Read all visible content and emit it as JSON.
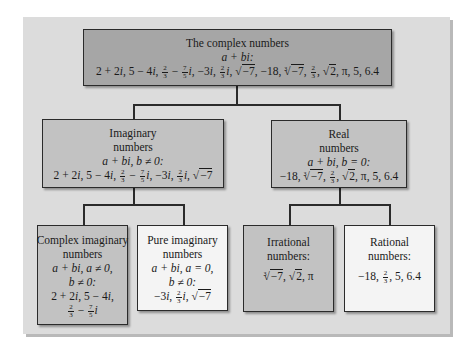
{
  "diagram": {
    "title": "The complex numbers",
    "nodes": {
      "complex": {
        "title": "The complex numbers",
        "form": "a + bi:",
        "examples": [
          "2 + 2i",
          "5 − 4i",
          "2/3 − 7/5 i",
          "−3i",
          "2/3 i",
          "√−7",
          "−18",
          "∛−7",
          "2/3",
          "√2",
          "π",
          "5",
          "6.4"
        ]
      },
      "imaginary": {
        "title_line1": "Imaginary",
        "title_line2": "numbers",
        "form": "a + bi, b ≠ 0:",
        "examples": [
          "2 + 2i",
          "5 − 4i",
          "2/3 − 7/5 i",
          "−3i",
          "2/3 i",
          "√−7"
        ]
      },
      "real": {
        "title_line1": "Real",
        "title_line2": "numbers",
        "form": "a + bi, b = 0:",
        "examples": [
          "−18",
          "∛−7",
          "2/3",
          "√2",
          "π",
          "5",
          "6.4"
        ]
      },
      "complex_imaginary": {
        "title_line1": "Complex imaginary",
        "title_line2": "numbers",
        "form_line1": "a + bi, a ≠ 0,",
        "form_line2": "b ≠ 0:",
        "examples": [
          "2 + 2i",
          "5 − 4i",
          "2/3 − 7/5 i"
        ]
      },
      "pure_imaginary": {
        "title_line1": "Pure imaginary",
        "title_line2": "numbers",
        "form_line1": "a + bi, a = 0,",
        "form_line2": "b ≠ 0:",
        "examples": [
          "−3i",
          "2/3 i",
          "√−7"
        ]
      },
      "irrational": {
        "title_line1": "Irrational",
        "title_line2": "numbers:",
        "examples": [
          "∛−7",
          "√2",
          "π"
        ]
      },
      "rational": {
        "title_line1": "Rational",
        "title_line2": "numbers:",
        "examples": [
          "−18",
          "2/3",
          "5",
          "6.4"
        ]
      }
    },
    "edges": [
      [
        "complex",
        "imaginary"
      ],
      [
        "complex",
        "real"
      ],
      [
        "imaginary",
        "complex_imaginary"
      ],
      [
        "imaginary",
        "pure_imaginary"
      ],
      [
        "real",
        "irrational"
      ],
      [
        "real",
        "rational"
      ]
    ],
    "colors": {
      "panel": "#dcdcdc",
      "dark_box": "#a6a6a6",
      "mid_box": "#c2c2c2",
      "light_box": "#f4f4f4",
      "line": "#2b2b2b"
    }
  },
  "txt": {
    "n2": "2",
    "n3": "3",
    "n5": "5",
    "n7": "7",
    "neg7": "−7",
    "neg18": "−18",
    "n2val": "2",
    "t_2p2i": "2 + 2",
    "t_i": "i",
    "t_5m4": "5 − 4",
    "minus": " − ",
    "t_m3": "−3",
    "comma": ", ",
    "pi": "π",
    "t_5": "5",
    "t_64": "6.4",
    "a": "a",
    "b": "b",
    "plus": " + ",
    "bi": "bi"
  }
}
